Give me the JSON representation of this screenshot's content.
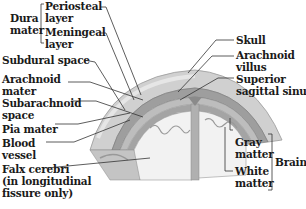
{
  "diagram": {
    "colors": {
      "skull": "#d4d4d4",
      "dura": "#a8a8a8",
      "brain_gray": "#9a9a9a",
      "brain_white": "#f0f0f0",
      "leader_line": "#333333",
      "text": "#1a1a1a"
    },
    "labels": {
      "dura_mater": {
        "line1": "Dura",
        "line2": "mater"
      },
      "periosteal_layer": {
        "line1": "Periosteal",
        "line2": "layer"
      },
      "meningeal_layer": {
        "line1": "Meningeal",
        "line2": "layer"
      },
      "subdural_space": {
        "line1": "Subdural space"
      },
      "arachnoid_mater": {
        "line1": "Arachnoid",
        "line2": "mater"
      },
      "subarachnoid_space": {
        "line1": "Subarachnoid",
        "line2": "space"
      },
      "pia_mater": {
        "line1": "Pia mater"
      },
      "blood_vessel": {
        "line1": "Blood",
        "line2": "vessel"
      },
      "falx_cerebri": {
        "line1": "Falx cerebri",
        "line2": "(in longitudinal",
        "line3": "fissure only)"
      },
      "skull": {
        "line1": "Skull"
      },
      "arachnoid_villus": {
        "line1": "Arachnoid",
        "line2": "villus"
      },
      "superior_sagittal_sinus": {
        "line1": "Superior",
        "line2": "sagittal sinus"
      },
      "gray_matter": {
        "line1": "Gray",
        "line2": "matter"
      },
      "white_matter": {
        "line1": "White",
        "line2": "matter"
      },
      "brain": {
        "line1": "Brain"
      }
    }
  }
}
